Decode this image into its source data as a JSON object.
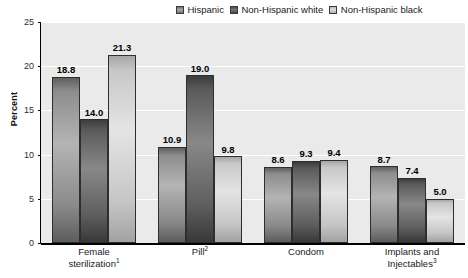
{
  "chart_data": {
    "type": "bar",
    "title": "",
    "xlabel": "",
    "ylabel": "Percent",
    "ylim": [
      0,
      25
    ],
    "yticks": [
      0,
      5,
      10,
      15,
      20,
      25
    ],
    "grid": true,
    "legend_position": "top-right",
    "categories": [
      "Female sterilization",
      "Pill",
      "Condom",
      "Implants and Injectables"
    ],
    "category_footnotes": [
      "1",
      "2",
      "",
      "3"
    ],
    "category_lines": [
      [
        "Female",
        "sterilization"
      ],
      [
        "Pill"
      ],
      [
        "Condom"
      ],
      [
        "Implants and",
        "Injectables"
      ]
    ],
    "series": [
      {
        "name": "Hispanic",
        "color": "#8d8d8d",
        "values": [
          18.8,
          10.9,
          8.6,
          8.7
        ],
        "labels": [
          "18.8",
          "10.9",
          "8.6",
          "8.7"
        ]
      },
      {
        "name": "Non-Hispanic white",
        "color": "#5a5a5a",
        "values": [
          14.0,
          19.0,
          9.3,
          7.4
        ],
        "labels": [
          "14.0",
          "19.0",
          "9.3",
          "7.4"
        ]
      },
      {
        "name": "Non-Hispanic black",
        "color": "#c8c8c8",
        "values": [
          21.3,
          9.8,
          9.4,
          5.0
        ],
        "labels": [
          "21.3",
          "9.8",
          "9.4",
          "5.0"
        ]
      }
    ]
  },
  "legend": {
    "items": [
      {
        "label": "Hispanic"
      },
      {
        "label": "Non-Hispanic white"
      },
      {
        "label": "Non-Hispanic black"
      }
    ]
  },
  "axis": {
    "y_title": "Percent",
    "y_tick_labels": [
      "0",
      "5",
      "10",
      "15",
      "20",
      "25"
    ]
  },
  "colors": {
    "plot_background": "#eaeaea",
    "gridline": "#ffffff",
    "axis": "#000000",
    "text": "#1a1a1a"
  }
}
